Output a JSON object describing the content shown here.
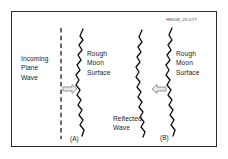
{
  "figure": {
    "id_label": "H8K08_23-077",
    "frame": {
      "stroke_color": "#2b2b2b",
      "background": "#ffffff"
    },
    "labels": {
      "incoming_plane_wave": "Incoming\nPlane\nWave",
      "incoming_plane_wave_lines": [
        "Incoming",
        "Plane",
        "Wave"
      ],
      "rough_moon_surface_lines": [
        "Rough",
        "Moon",
        "Surface"
      ],
      "reflected_wave_lines": [
        "Reflected",
        "Wave"
      ],
      "panel_a": "(A)",
      "panel_b": "(B)"
    },
    "panels": [
      {
        "name": "panel-a",
        "caption": "(A)",
        "elements": [
          "incoming-plane-wave-text",
          "dashed-wavefront-line",
          "right-arrow",
          "rough-surface-wavy-line",
          "rough-moon-surface-text"
        ]
      },
      {
        "name": "panel-b",
        "caption": "(B)",
        "elements": [
          "reflected-wave-wavy-line",
          "left-arrow",
          "reflected-wave-text",
          "rough-surface-wavy-line",
          "rough-moon-surface-text"
        ]
      }
    ],
    "colors": {
      "ink": "#222222",
      "frame": "#2b2b2b",
      "arrow_fill": "#e8e8e8",
      "arrow_stroke": "#777777",
      "dashed_line": "#1a1a1a",
      "wavy_line": "#111111"
    }
  }
}
